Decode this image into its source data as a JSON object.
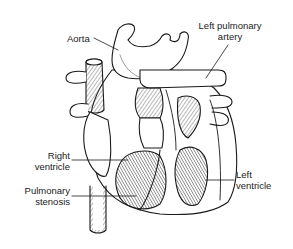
{
  "diagram": {
    "labels": {
      "aorta": "Aorta",
      "left_pulmonary_artery_1": "Left pulmonary",
      "left_pulmonary_artery_2": "artery",
      "right_ventricle_1": "Right",
      "right_ventricle_2": "ventricle",
      "pulmonary_stenosis_1": "Pulmonary",
      "pulmonary_stenosis_2": "stenosis",
      "left_ventricle_1": "Left",
      "left_ventricle_2": "ventricle"
    },
    "colors": {
      "ink": "#1a1a1a",
      "background": "#ffffff"
    }
  }
}
